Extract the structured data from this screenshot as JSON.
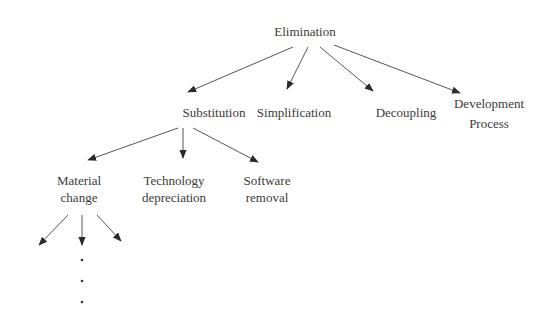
{
  "diagram": {
    "type": "tree",
    "root": {
      "label": "Elimination",
      "children": [
        {
          "label": "Substitution",
          "children": [
            {
              "label_lines": [
                "Material",
                "change"
              ],
              "continues": true
            },
            {
              "label_lines": [
                "Technology",
                "depreciation"
              ]
            },
            {
              "label_lines": [
                "Software",
                "removal"
              ]
            }
          ]
        },
        {
          "label": "Simplification"
        },
        {
          "label": "Decoupling"
        },
        {
          "label_lines": [
            "Development",
            "Process"
          ]
        }
      ]
    },
    "continuation_marker": "… (vertical ellipsis)",
    "colors": {
      "line": "#555555",
      "arrowhead": "#2a2a2a",
      "text": "#3a3a3a",
      "background": "#ffffff"
    }
  },
  "nodes": {
    "elimination": "Elimination",
    "substitution": "Substitution",
    "simplification": "Simplification",
    "decoupling": "Decoupling",
    "development_1": "Development",
    "development_2": "Process",
    "material_1": "Material",
    "material_2": "change",
    "technology_1": "Technology",
    "technology_2": "depreciation",
    "software_1": "Software",
    "software_2": "removal"
  }
}
